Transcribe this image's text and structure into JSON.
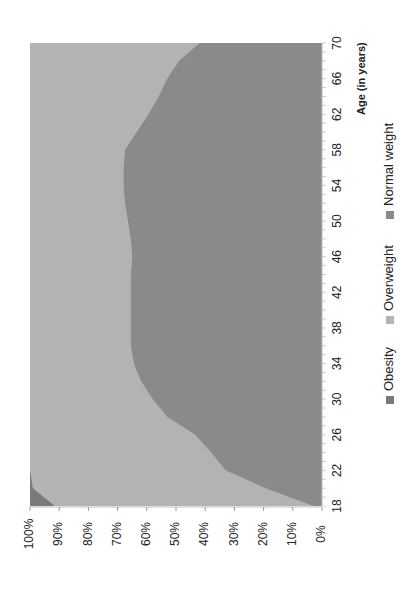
{
  "chart_data": {
    "type": "area",
    "stacked": "percent",
    "orientation_note": "rotated 90 degrees clockwise",
    "title": "",
    "xlabel": "Age (in years)",
    "ylabel": "",
    "x": [
      18,
      20,
      22,
      24,
      26,
      28,
      30,
      32,
      34,
      36,
      38,
      40,
      42,
      44,
      46,
      48,
      50,
      52,
      54,
      56,
      58,
      60,
      62,
      64,
      66,
      68,
      70
    ],
    "x_ticks": [
      18,
      22,
      26,
      30,
      34,
      38,
      42,
      46,
      50,
      54,
      58,
      62,
      66,
      70
    ],
    "y_ticks": [
      "0%",
      "10%",
      "20%",
      "30%",
      "40%",
      "50%",
      "60%",
      "70%",
      "80%",
      "90%",
      "100%"
    ],
    "ylim": [
      0,
      100
    ],
    "grid": false,
    "legend_position": "bottom",
    "series": [
      {
        "name": "Normal weight",
        "color": "#8a8a8a",
        "values": [
          3,
          19.5,
          33,
          38,
          43.5,
          53,
          58,
          62,
          64.5,
          65.5,
          65.5,
          65.5,
          65.5,
          65.5,
          65,
          65.5,
          66.5,
          67.5,
          68,
          68,
          67.5,
          63.5,
          59.5,
          56,
          53,
          49,
          42
        ]
      },
      {
        "name": "Overweight",
        "color": "#b3b3b3",
        "values": [
          88.5,
          79.5,
          67,
          62,
          56.5,
          47,
          42,
          38,
          35.5,
          34.5,
          34.5,
          34.5,
          34.5,
          34.5,
          35,
          34.5,
          33.5,
          32.5,
          32,
          32,
          32.5,
          36.5,
          40.5,
          44,
          47,
          51,
          58
        ]
      },
      {
        "name": "Obesity",
        "color": "#7a7a7a",
        "values": [
          8.5,
          1,
          0,
          0,
          0,
          0,
          0,
          0,
          0,
          0,
          0,
          0,
          0,
          0,
          0,
          0,
          0,
          0,
          0,
          0,
          0,
          0,
          0,
          0,
          0,
          0,
          0
        ]
      }
    ]
  },
  "legend": {
    "items": [
      {
        "label": "Obesity",
        "color": "#7a7a7a"
      },
      {
        "label": "Overweight",
        "color": "#b3b3b3"
      },
      {
        "label": "Normal weight",
        "color": "#8a8a8a"
      }
    ]
  },
  "axis": {
    "x_title": "Age (in years)"
  }
}
